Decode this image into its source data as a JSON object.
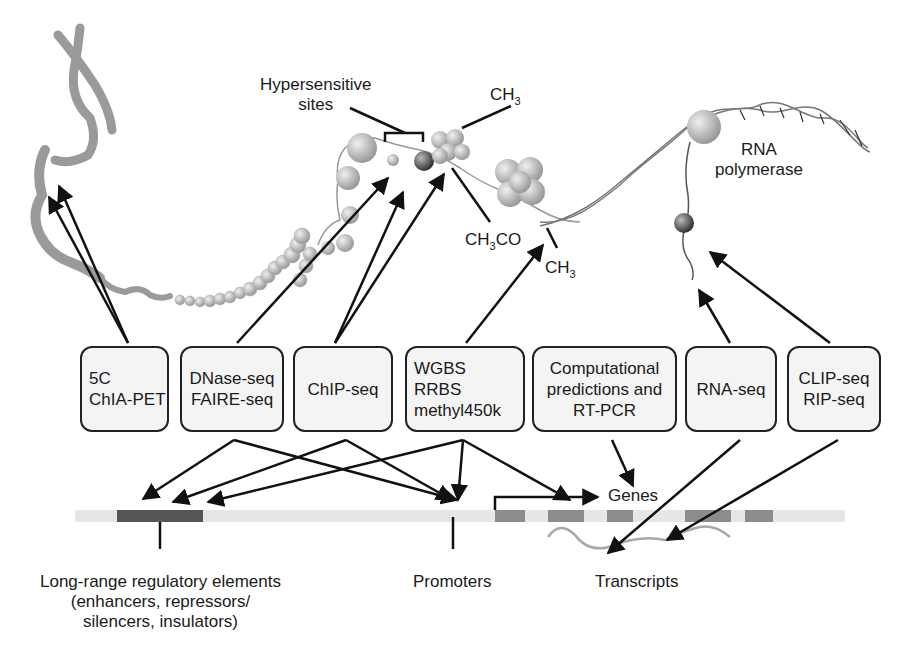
{
  "diagram": {
    "top_labels": {
      "hypersensitive_sites": [
        "Hypersensitive",
        "sites"
      ],
      "ch3_top": {
        "main": "CH",
        "sub": "3"
      },
      "ch3co": {
        "main1": "CH",
        "sub": "3",
        "main2": "CO"
      },
      "ch3_bottom": {
        "main": "CH",
        "sub": "3"
      },
      "rna_polymerase": [
        "RNA",
        "polymerase"
      ]
    },
    "assay_boxes": [
      {
        "id": "5c-chiapet",
        "lines": [
          "5C",
          "ChIA-PET"
        ]
      },
      {
        "id": "dnase-faire",
        "lines": [
          "DNase-seq",
          "FAIRE-seq"
        ]
      },
      {
        "id": "chip-seq",
        "lines": [
          "ChIP-seq"
        ]
      },
      {
        "id": "methylation",
        "lines": [
          "WGBS",
          "RRBS",
          "methyl450k"
        ]
      },
      {
        "id": "computational",
        "lines": [
          "Computational",
          "predictions and",
          "RT-PCR"
        ]
      },
      {
        "id": "rna-seq",
        "lines": [
          "RNA-seq"
        ]
      },
      {
        "id": "clip-rip",
        "lines": [
          "CLIP-seq",
          "RIP-seq"
        ]
      }
    ],
    "bottom_labels": {
      "genes": "Genes",
      "long_range": [
        "Long-range regulatory elements",
        "(enhancers, repressors/",
        "silencers, insulators)"
      ],
      "promoters": "Promoters",
      "transcripts": "Transcripts"
    },
    "colors": {
      "arrow": "#111111",
      "chromatin": "#9a9a9a",
      "box_fill": "#f4f4f4",
      "regulatory_block": "#555555",
      "gene_exon": "#8c8c8c",
      "transcript": "#a8a8a8"
    }
  }
}
